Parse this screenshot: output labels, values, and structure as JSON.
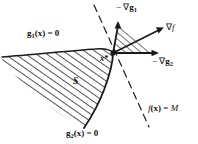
{
  "figure": {
    "kind": "constrained-optimization-kkt-diagram",
    "background_color": "#ffffff",
    "ink_color": "#1a1a1a"
  },
  "labels": {
    "constraint_g1": "g1(x) = 0",
    "constraint_g2": "g2(x) = 0",
    "objective_level": "f(x) = M",
    "neg_grad_g1": "−∇g1",
    "grad_f": "∇f",
    "neg_grad_g2": "−∇g2",
    "optimum_point": "x*",
    "feasible_region": "S"
  },
  "curves": {
    "g1_boundary": "solid curve sweeping from left edge rightward, concave down, meeting x*",
    "g2_boundary": "solid curve from x* descending and curving left to bottom",
    "level_set": "dashed straight line through x* from upper-left to lower-right"
  },
  "vectors": [
    {
      "name": "neg_grad_g1",
      "direction": "up",
      "from": [
        113,
        53
      ],
      "to": [
        118,
        22
      ]
    },
    {
      "name": "grad_f",
      "direction": "up-right",
      "from": [
        113,
        53
      ],
      "to": [
        164,
        28
      ]
    },
    {
      "name": "neg_grad_g2",
      "direction": "right",
      "from": [
        113,
        53
      ],
      "to": [
        159,
        53
      ]
    }
  ],
  "hatching": {
    "feasible_region_fill": "diagonal parallel lines",
    "cone_fill": "diagonal parallel lines between neg_grad_g1 and neg_grad_g2"
  }
}
